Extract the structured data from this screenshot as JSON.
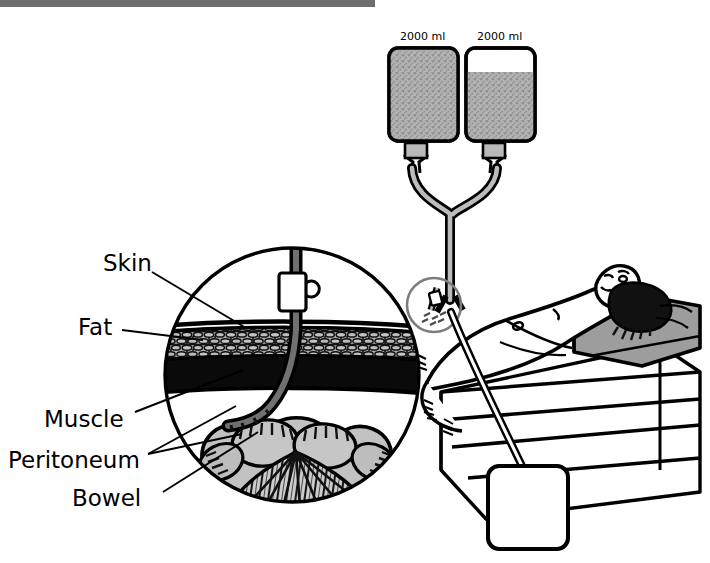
{
  "figure": {
    "top_rule_color": "#6e6e6e"
  },
  "colors": {
    "ink": "#000000",
    "fill_gray": "#a8a8a8",
    "mid_gray": "#8f8f8f",
    "light_gray": "#c9c9c9",
    "pale_gray": "#d9d9d9",
    "white": "#ffffff"
  },
  "bags": [
    {
      "name": "dialysate-bag-left",
      "caption": "2000 ml",
      "fill_percent": 100
    },
    {
      "name": "dialysate-bag-right",
      "caption": "2000 ml",
      "fill_percent": 74
    }
  ],
  "drain_bag": {
    "name": "drainage-bag",
    "caption": "",
    "fill_percent": 0
  },
  "labels": [
    {
      "id": "skin",
      "text": "Skin",
      "x": 103,
      "y": 254
    },
    {
      "id": "fat",
      "text": "Fat",
      "x": 78,
      "y": 318
    },
    {
      "id": "muscle",
      "text": "Muscle",
      "x": 45,
      "y": 410
    },
    {
      "id": "peritoneum",
      "text": "Peritoneum",
      "x": 10,
      "y": 450
    },
    {
      "id": "bowel",
      "text": "Bowel",
      "x": 73,
      "y": 488
    }
  ],
  "inset": {
    "name": "cross-section-inset",
    "center_x": 292,
    "center_y": 375,
    "radius": 129,
    "layers": [
      "Skin",
      "Fat",
      "Muscle",
      "Peritoneum",
      "Bowel"
    ]
  },
  "callout": {
    "name": "insertion-site-highlight",
    "center_x": 434,
    "center_y": 305,
    "radius": 27
  },
  "patient": {
    "name": "patient-supine",
    "pillow": "pillow",
    "bed": "bed-frame"
  }
}
